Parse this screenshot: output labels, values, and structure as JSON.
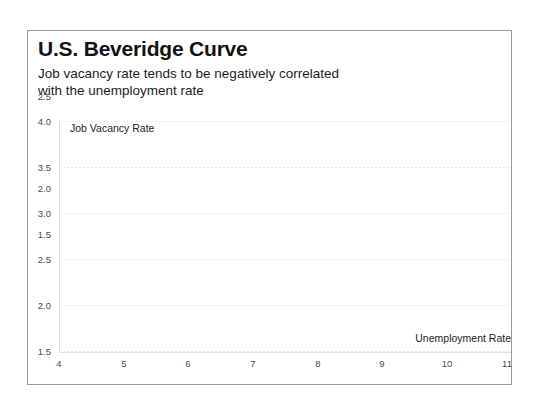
{
  "chart_data": {
    "type": "scatter",
    "title": "U.S. Beveridge Curve",
    "subtitle_lines": [
      "Job vacancy rate tends to be negatively correlated",
      "with the unemployment rate"
    ],
    "xlabel": "Unemployment Rate",
    "ylabel": "Job Vacancy Rate",
    "xlim": [
      4,
      11
    ],
    "ylim": [
      1.5,
      4.0
    ],
    "xticks": [
      4,
      5,
      6,
      7,
      8,
      9,
      10,
      11
    ],
    "xtick_labels": [
      "4",
      "5",
      "6",
      "7",
      "8",
      "9",
      "10",
      "11"
    ],
    "yticks": [
      1.5,
      2.0,
      2.5,
      3.0,
      3.5,
      4.0
    ],
    "ytick_labels": [
      "1.5",
      "2.0",
      "2.5",
      "3.0",
      "3.5",
      "4.0"
    ],
    "grid": true,
    "grid_axis": "y",
    "legend": false,
    "series": [
      {
        "name": "Job Vacancy Rate",
        "x": [],
        "y": []
      }
    ],
    "annotations": []
  },
  "style": {
    "background": "#ffffff",
    "frame_border": "#9a9a9a",
    "title_color": "#121212",
    "subtitle_color": "#1d1d1d",
    "tick_color": "#4a4a4a",
    "gridline_color": "#e9e9e9",
    "axis_color": "#dcdcdc"
  }
}
